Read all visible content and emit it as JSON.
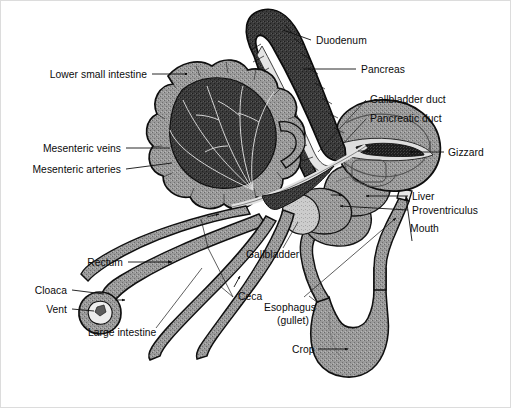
{
  "figure": {
    "background_color": "#ffffff",
    "ink_color": "#111111",
    "tissue_mid": "#8c8c8c",
    "tissue_dark": "#2e2e2e",
    "tissue_light": "#c9c9c9"
  },
  "labels": {
    "lower_small_intestine": "Lower small intestine",
    "mesenteric_veins": "Mesenteric veins",
    "mesenteric_arteries": "Mesenteric arteries",
    "rectum": "Rectum",
    "cloaca": "Cloaca",
    "vent": "Vent",
    "large_intestine": "Large intestine",
    "ceca": "Ceca",
    "esophagus_line1": "Esophagus",
    "esophagus_line2": "(gullet)",
    "crop": "Crop",
    "gallbladder": "Gallbladder",
    "duodenum": "Duodenum",
    "pancreas": "Pancreas",
    "gallbladder_duct": "Gallbladder duct",
    "pancreatic_duct": "Pancreatic duct",
    "gizzard": "Gizzard",
    "liver": "Liver",
    "proventriculus": "Proventriculus",
    "mouth": "Mouth"
  },
  "label_positions": {
    "lower_small_intestine": {
      "x": 147,
      "y": 78,
      "anchor": "end"
    },
    "mesenteric_veins": {
      "x": 121,
      "y": 151,
      "anchor": "end"
    },
    "mesenteric_arteries": {
      "x": 121,
      "y": 172,
      "anchor": "end"
    },
    "rectum": {
      "x": 121,
      "y": 266,
      "anchor": "end"
    },
    "cloaca": {
      "x": 66,
      "y": 293,
      "anchor": "end"
    },
    "vent": {
      "x": 66,
      "y": 312,
      "anchor": "end"
    },
    "large_intestine": {
      "x": 88,
      "y": 335,
      "anchor": "start"
    },
    "ceca": {
      "x": 237,
      "y": 299,
      "anchor": "start"
    },
    "esophagus_line1": {
      "x": 265,
      "y": 310,
      "anchor": "start"
    },
    "esophagus_line2": {
      "x": 277,
      "y": 323,
      "anchor": "start"
    },
    "crop": {
      "x": 293,
      "y": 353,
      "anchor": "start"
    },
    "gallbladder": {
      "x": 247,
      "y": 257,
      "anchor": "start"
    },
    "duodenum": {
      "x": 316,
      "y": 44,
      "anchor": "start"
    },
    "pancreas": {
      "x": 361,
      "y": 72,
      "anchor": "start"
    },
    "gallbladder_duct": {
      "x": 371,
      "y": 101,
      "anchor": "start"
    },
    "pancreatic_duct": {
      "x": 371,
      "y": 121,
      "anchor": "start"
    },
    "gizzard": {
      "x": 449,
      "y": 155,
      "anchor": "start"
    },
    "liver": {
      "x": 413,
      "y": 199,
      "anchor": "start"
    },
    "proventriculus": {
      "x": 413,
      "y": 213,
      "anchor": "start"
    },
    "mouth": {
      "x": 411,
      "y": 231,
      "anchor": "start"
    }
  }
}
